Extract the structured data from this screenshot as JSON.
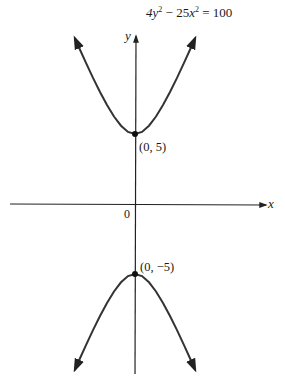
{
  "chart_data": {
    "type": "line",
    "title": "",
    "equation": {
      "lhs_term1_coef": "4",
      "lhs_term1_var": "y",
      "op": "−",
      "lhs_term2_coef": "25",
      "lhs_term2_var": "x",
      "exp": "2",
      "eq_sign": "=",
      "rhs": "100",
      "full": "4y^2 - 25x^2 = 100"
    },
    "xlabel": "x",
    "ylabel": "y",
    "origin_label": "0",
    "xlim": [
      -9.3,
      9.3
    ],
    "ylim": [
      -12.2,
      12
    ],
    "grid": false,
    "series": [
      {
        "name": "upper branch",
        "x": [
          -4.3,
          -4,
          -3.5,
          -3,
          -2.5,
          -2,
          -1.5,
          -1,
          -0.5,
          0,
          0.5,
          1,
          1.5,
          2,
          2.5,
          3,
          3.5,
          4,
          4.3
        ],
        "y": [
          11.86,
          11.18,
          10.08,
          9.01,
          8.0,
          7.07,
          6.25,
          5.59,
          5.15,
          5,
          5.15,
          5.59,
          6.25,
          7.07,
          8.0,
          9.01,
          10.08,
          11.18,
          11.86
        ]
      },
      {
        "name": "lower branch",
        "x": [
          -4.3,
          -4,
          -3.5,
          -3,
          -2.5,
          -2,
          -1.5,
          -1,
          -0.5,
          0,
          0.5,
          1,
          1.5,
          2,
          2.5,
          3,
          3.5,
          4,
          4.3
        ],
        "y": [
          -11.86,
          -11.18,
          -10.08,
          -9.01,
          -8.0,
          -7.07,
          -6.25,
          -5.59,
          -5.15,
          -5,
          -5.15,
          -5.59,
          -6.25,
          -7.07,
          -8.0,
          -9.01,
          -10.08,
          -11.18,
          -11.86
        ]
      }
    ],
    "points": [
      {
        "x": 0,
        "y": 5,
        "label": "(0, 5)"
      },
      {
        "x": 0,
        "y": -5,
        "label": "(0, −5)"
      }
    ]
  }
}
